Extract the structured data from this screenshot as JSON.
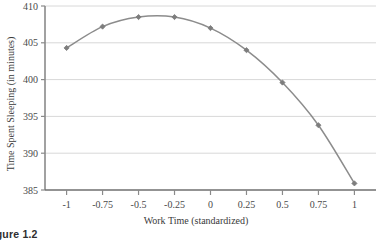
{
  "figure": {
    "caption": "Figure 1.2"
  },
  "chart_data": {
    "type": "line",
    "title": "",
    "xlabel": "Work Time (standardized)",
    "ylabel": "Time Spent Sleeping (in minutes)",
    "x": [
      -1,
      -0.75,
      -0.5,
      -0.25,
      0,
      0.25,
      0.5,
      0.75,
      1
    ],
    "values": [
      404.3,
      407.2,
      408.5,
      408.5,
      407.0,
      404.0,
      399.6,
      393.8,
      385.9
    ],
    "series": [
      {
        "name": "Time Spent Sleeping",
        "values": [
          404.3,
          407.2,
          408.5,
          408.5,
          407.0,
          404.0,
          399.6,
          393.8,
          385.9
        ]
      }
    ],
    "xlim": [
      -1.15,
      1.15
    ],
    "ylim": [
      385,
      410
    ],
    "xticks": [
      -1,
      -0.75,
      -0.5,
      -0.25,
      0,
      0.25,
      0.5,
      0.75,
      1
    ],
    "xtick_labels": [
      "-1",
      "-0.75",
      "-0.5",
      "-0.25",
      "0",
      "0.25",
      "0.5",
      "0.75",
      "1"
    ],
    "yticks": [
      385,
      390,
      395,
      400,
      405,
      410
    ],
    "ytick_labels": [
      "385",
      "390",
      "395",
      "400",
      "405",
      "410"
    ],
    "grid": "horizontal",
    "legend": "none",
    "marker": "diamond",
    "line_color": "#8c8c8c",
    "marker_color": "#7d7d7d",
    "grid_color": "#d8d8d8",
    "axis_color": "#8a8a8a"
  }
}
